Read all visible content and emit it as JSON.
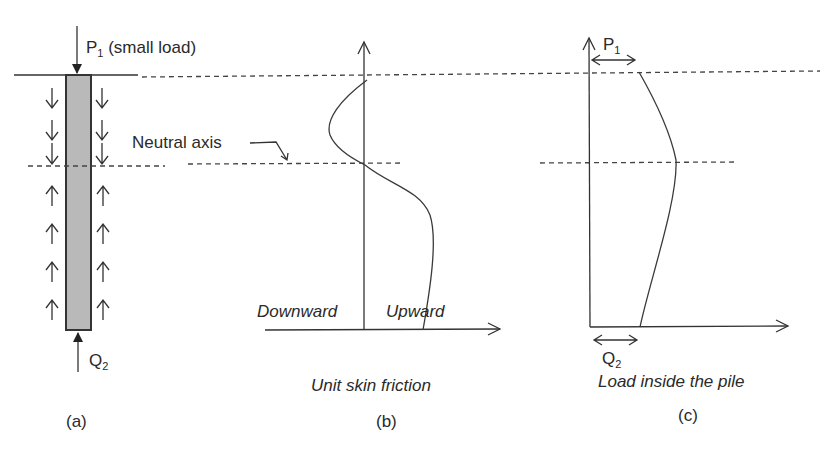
{
  "figure": {
    "panel_a": {
      "caption": "(a)",
      "top_load": "P",
      "top_load_sub": "1",
      "top_load_note": "(small load)",
      "bottom_load": "Q",
      "bottom_load_sub": "2",
      "neutral_axis_label": "Neutral axis",
      "friction_arrows_above_neutral": "downward",
      "friction_arrows_below_neutral": "upward",
      "pile_color": "#b9b9b9"
    },
    "panel_b": {
      "caption": "(b)",
      "xlabel": "Unit skin friction",
      "left_label": "Downward",
      "right_label": "Upward"
    },
    "panel_c": {
      "caption": "(c)",
      "xlabel": "Load inside the pile",
      "top_label": "P",
      "top_label_sub": "1",
      "bottom_label": "Q",
      "bottom_label_sub": "2"
    }
  }
}
